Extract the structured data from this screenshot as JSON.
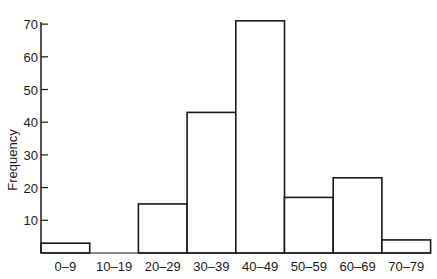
{
  "chart_data": {
    "type": "bar",
    "title": "",
    "xlabel": "",
    "ylabel": "Frequency",
    "categories": [
      "0–9",
      "10–19",
      "20–29",
      "30–39",
      "40–49",
      "50–59",
      "60–69",
      "70–79"
    ],
    "values": [
      3,
      0,
      15,
      43,
      71,
      17,
      23,
      4
    ],
    "yticks": [
      10,
      20,
      30,
      40,
      50,
      60,
      70
    ],
    "ylim": [
      0,
      72
    ],
    "grid": false,
    "legend": null,
    "histogram": true
  },
  "colors": {
    "stroke": "#1a1a1a",
    "fill": "#ffffff"
  }
}
